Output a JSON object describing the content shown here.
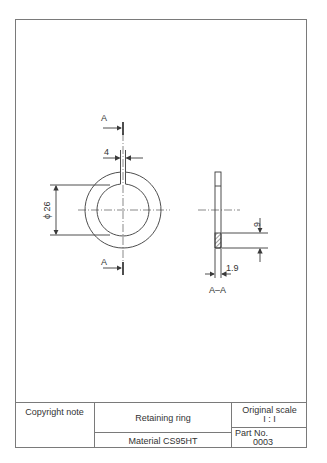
{
  "drawing": {
    "front_view": {
      "section_marker_top": "A",
      "section_marker_bottom": "A",
      "gap_dimension": "4",
      "diameter_dimension": "ϕ 26"
    },
    "section_view": {
      "label": "A–A",
      "thickness_dimension": "1.9",
      "width_dimension": "6"
    }
  },
  "title_block": {
    "copyright": "Copyright note",
    "title": "Retaining ring",
    "material": "Material CS95HT",
    "scale_label": "Original scale",
    "scale_value": "I : I",
    "part_label": "Part No.",
    "part_number": "0003"
  },
  "colors": {
    "line": "#3a3a3a",
    "border": "#7a7a7a"
  }
}
